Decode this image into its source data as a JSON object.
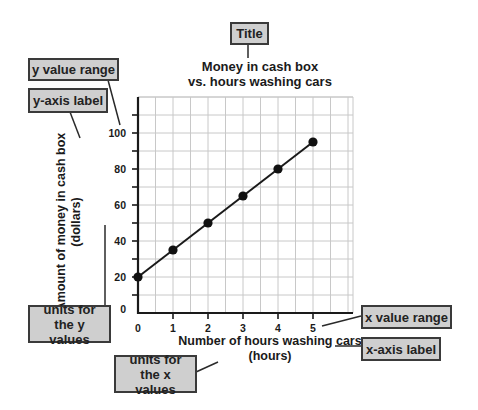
{
  "chart_data": {
    "type": "line",
    "title": "Money in cash box vs. hours washing cars",
    "title_lines": [
      "Money in cash box",
      "vs. hours washing cars"
    ],
    "xlabel": "Number of hours washing cars",
    "xunits": "(hours)",
    "ylabel": "Amount of money in cash box",
    "yunits": "(dollars)",
    "x": [
      0,
      1,
      2,
      3,
      4,
      5
    ],
    "values": [
      20,
      35,
      50,
      65,
      80,
      95
    ],
    "x_ticks": [
      "0",
      "1",
      "2",
      "3",
      "4",
      "5"
    ],
    "y_ticks": [
      "0",
      "20",
      "40",
      "60",
      "80",
      "100"
    ],
    "xlim": [
      0,
      6
    ],
    "ylim": [
      0,
      120
    ],
    "grid": true,
    "markers": true
  },
  "callouts": {
    "title": "Title",
    "y_value_range": "y value range",
    "y_axis_label": "y-axis label",
    "units_y": "units for the y values",
    "units_x": "units for the x values",
    "x_value_range": "x value range",
    "x_axis_label": "x-axis label"
  },
  "colors": {
    "callout_fill": "#cfcfcf",
    "callout_border": "#3a3a3a",
    "grid": "#c8c8c8",
    "line": "#1a1a1a"
  }
}
